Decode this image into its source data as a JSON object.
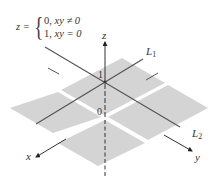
{
  "figure": {
    "equation": {
      "lhs": "z =",
      "cases": [
        {
          "value": "0,",
          "condition": "xy ≠ 0"
        },
        {
          "value": "1,",
          "condition": "xy = 0"
        }
      ]
    },
    "axes": {
      "x_label": "x",
      "y_label": "y",
      "z_label": "z"
    },
    "lines": [
      {
        "name": "L",
        "subscript": "1"
      },
      {
        "name": "L",
        "subscript": "2"
      }
    ],
    "ticks": {
      "z_one": "1",
      "origin": "0"
    },
    "colors": {
      "plane": "#d4d4d4",
      "line": "#555555",
      "axis": "#333333",
      "background": "#ffffff"
    }
  }
}
